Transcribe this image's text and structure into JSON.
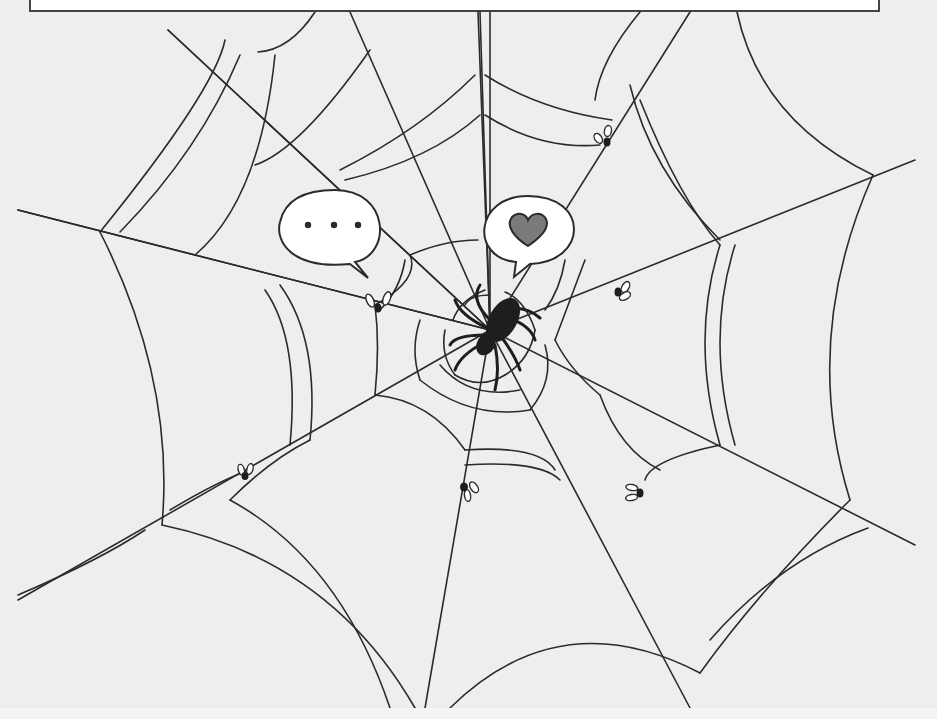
{
  "image": {
    "subject": "Cartoon spider web with spider at center, flies caught in web, and two speech bubbles",
    "colors": {
      "background": "#eeeeee",
      "line": "#2b2b2b",
      "bubble_fill": "#ffffff",
      "heart_fill": "#7a7a7a",
      "spider_fill": "#1e1e1e"
    }
  },
  "bubbles": [
    {
      "id": "ellipsis-bubble",
      "content": "• • •"
    },
    {
      "id": "heart-bubble",
      "content": "♥"
    }
  ],
  "flies_count": 6,
  "a11y": {
    "description": "Spider in a web thinking of love, with flies trapped around it"
  }
}
